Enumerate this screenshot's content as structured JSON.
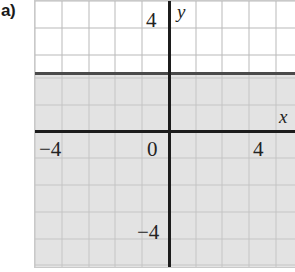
{
  "figure": {
    "part_label": "a)"
  },
  "axes": {
    "x_axis_name": "x",
    "y_axis_name": "y"
  },
  "ticks": {
    "x_negative_four": "−4",
    "x_zero": "0",
    "x_four": "4",
    "y_four": "4",
    "y_negative_four": "−4"
  },
  "colors": {
    "shaded_region": "#e3e3e3",
    "grid_line": "#b9b9b9",
    "axis_line": "#1c1c1c",
    "boundary_line": "#4a4a4a",
    "background": "#ffffff",
    "text": "#232323"
  },
  "chart_data": {
    "type": "line",
    "title": "",
    "subtitle": "",
    "xlabel": "x",
    "ylabel": "y",
    "xlim": [
      -5,
      4.7
    ],
    "ylim": [
      -5,
      4.9
    ],
    "xticks": [
      -4,
      0,
      4
    ],
    "xticklabels": [
      "−4",
      "0",
      "4"
    ],
    "yticks": [
      4,
      -4
    ],
    "yticklabels": [
      "4",
      "−4"
    ],
    "grid": true,
    "grid_spacing": 1,
    "legend": null,
    "series": [
      {
        "name": "boundary",
        "type": "line",
        "style": "solid",
        "equation": "y = 2",
        "x": [
          -5,
          4.7
        ],
        "values": [
          2,
          2
        ]
      }
    ],
    "shaded_regions": [
      {
        "name": "solution-region",
        "inequality": "y ≤ 2",
        "fill": "#e3e3e3",
        "extent": {
          "y_from": -5,
          "y_to": 2
        }
      }
    ],
    "annotations": []
  }
}
